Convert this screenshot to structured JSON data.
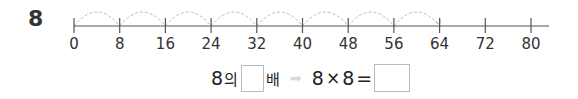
{
  "question": {
    "number": "8"
  },
  "number_line": {
    "ticks": [
      "0",
      "8",
      "16",
      "24",
      "32",
      "40",
      "48",
      "56",
      "64",
      "72",
      "80"
    ],
    "jumps": 8,
    "jump_size": 8,
    "colors": {
      "axis": "#555555",
      "jump_arc": "#bbbbbb"
    }
  },
  "equation": {
    "part1_base": "8",
    "part1_particle": "의",
    "part1_suffix": "배",
    "arrow": "➡",
    "multiplicand": "8",
    "times_sign": "×",
    "multiplier": "8",
    "equals": "=",
    "answer_box_1": "",
    "answer_box_2": ""
  }
}
